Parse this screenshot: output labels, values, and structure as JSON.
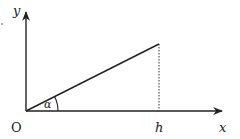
{
  "diagram": {
    "type": "geometry-right-triangle-on-axes",
    "labels": {
      "origin": "O",
      "x_axis": "x",
      "y_axis": "y",
      "angle": "α",
      "foot": "h"
    },
    "colors": {
      "stroke": "#222222",
      "background": "#ffffff"
    },
    "elements": [
      {
        "kind": "axis",
        "name": "x-axis",
        "from": [
          26,
          111
        ],
        "to": [
          222,
          111
        ],
        "arrow": true
      },
      {
        "kind": "axis",
        "name": "y-axis",
        "from": [
          26,
          111
        ],
        "to": [
          26,
          12
        ],
        "arrow": true
      },
      {
        "kind": "segment",
        "name": "hypotenuse",
        "from": [
          26,
          111
        ],
        "to": [
          159,
          44
        ]
      },
      {
        "kind": "dotted-segment",
        "name": "height-line",
        "from": [
          159,
          44
        ],
        "to": [
          159,
          111
        ]
      },
      {
        "kind": "arc",
        "name": "angle-alpha",
        "center": [
          26,
          111
        ],
        "radius": 32
      }
    ]
  }
}
